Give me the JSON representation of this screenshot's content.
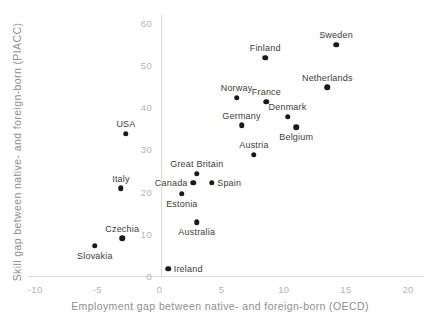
{
  "chart_data": {
    "type": "scatter",
    "title": "",
    "xlabel": "Employment gap between native- and foreign-born (OECD)",
    "ylabel": "Skill gap between native- and foreign-born (PIACC)",
    "x_ticks": [
      -10,
      -5,
      0,
      5,
      10,
      15,
      20
    ],
    "y_ticks": [
      0,
      10,
      20,
      30,
      40,
      50,
      60
    ],
    "xlim": [
      -11.5,
      21.5
    ],
    "ylim": [
      -0.5,
      62
    ],
    "grid": false,
    "legend": false,
    "axes_cross_at_origin": true,
    "marker_color": "#1a1a1a",
    "axis_line_color": "#d9d9d9",
    "tick_label_color": "#b4b4b4",
    "axis_title_color": "#8f8f8f",
    "point_label_color": "#3d3d3d",
    "points": [
      {
        "label": "Sweden",
        "x": 14.2,
        "y": 55,
        "label_pos": "top"
      },
      {
        "label": "Finland",
        "x": 8.5,
        "y": 52,
        "label_pos": "top"
      },
      {
        "label": "Netherlands",
        "x": 13.5,
        "y": 45,
        "label_pos": "top"
      },
      {
        "label": "Norway",
        "x": 6.2,
        "y": 42.5,
        "label_pos": "top"
      },
      {
        "label": "France",
        "x": 8.6,
        "y": 41.5,
        "label_pos": "top"
      },
      {
        "label": "Denmark",
        "x": 10.3,
        "y": 38,
        "label_pos": "top"
      },
      {
        "label": "Germany",
        "x": 6.6,
        "y": 36,
        "label_pos": "top"
      },
      {
        "label": "Belgium",
        "x": 11,
        "y": 35.5,
        "label_pos": "bottom"
      },
      {
        "label": "USA",
        "x": -2.7,
        "y": 34,
        "label_pos": "top"
      },
      {
        "label": "Austria",
        "x": 7.6,
        "y": 29,
        "label_pos": "top"
      },
      {
        "label": "Great Britain",
        "x": 3.0,
        "y": 24.5,
        "label_pos": "top"
      },
      {
        "label": "Canada",
        "x": 2.7,
        "y": 22.3,
        "label_pos": "left"
      },
      {
        "label": "Spain",
        "x": 4.2,
        "y": 22.3,
        "label_pos": "right"
      },
      {
        "label": "Italy",
        "x": -3.1,
        "y": 21,
        "label_pos": "top"
      },
      {
        "label": "Estonia",
        "x": 1.8,
        "y": 19.7,
        "label_pos": "bottom"
      },
      {
        "label": "Australia",
        "x": 3.0,
        "y": 13,
        "label_pos": "bottom"
      },
      {
        "label": "Czechia",
        "x": -3.0,
        "y": 9.2,
        "label_pos": "top"
      },
      {
        "label": "Slovakia",
        "x": -5.2,
        "y": 7.4,
        "label_pos": "bottom"
      },
      {
        "label": "Ireland",
        "x": 0.7,
        "y": 2,
        "label_pos": "right"
      }
    ]
  }
}
